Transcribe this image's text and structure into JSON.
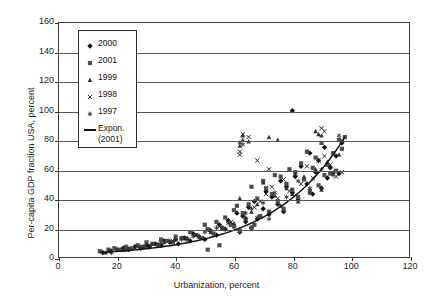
{
  "chart_data": {
    "type": "scatter",
    "title": "",
    "xlabel": "Urbanization, percent",
    "ylabel": "Per-capita GDP fraction USA, percent",
    "xlim": [
      0,
      120
    ],
    "ylim": [
      0,
      160
    ],
    "xticks": [
      0,
      20,
      40,
      60,
      80,
      100,
      120
    ],
    "yticks": [
      0,
      20,
      40,
      60,
      80,
      100,
      120,
      140,
      160
    ],
    "grid": "horizontal",
    "legend_position": "upper-left-inside",
    "legend": [
      {
        "label": "2000",
        "marker": "diamond"
      },
      {
        "label": "2001",
        "marker": "square"
      },
      {
        "label": "1999",
        "marker": "triangle"
      },
      {
        "label": "1998",
        "marker": "x"
      },
      {
        "label": "1997",
        "marker": "star"
      },
      {
        "label": "Expon.",
        "label2": "(2001)",
        "marker": "line"
      }
    ],
    "series": [
      {
        "name": "2000",
        "marker": "diamond",
        "points": [
          [
            15,
            3
          ],
          [
            18,
            4
          ],
          [
            20,
            5
          ],
          [
            22,
            6
          ],
          [
            24,
            5
          ],
          [
            26,
            7
          ],
          [
            28,
            6
          ],
          [
            30,
            8
          ],
          [
            31,
            7
          ],
          [
            33,
            9
          ],
          [
            35,
            8
          ],
          [
            36,
            11
          ],
          [
            38,
            10
          ],
          [
            40,
            12
          ],
          [
            41,
            9
          ],
          [
            43,
            13
          ],
          [
            45,
            11
          ],
          [
            46,
            16
          ],
          [
            48,
            14
          ],
          [
            50,
            12
          ],
          [
            52,
            18
          ],
          [
            54,
            15
          ],
          [
            55,
            22
          ],
          [
            57,
            19
          ],
          [
            58,
            25
          ],
          [
            60,
            21
          ],
          [
            61,
            30
          ],
          [
            62,
            17
          ],
          [
            63,
            28
          ],
          [
            64,
            24
          ],
          [
            65,
            34
          ],
          [
            66,
            20
          ],
          [
            67,
            38
          ],
          [
            68,
            26
          ],
          [
            70,
            33
          ],
          [
            71,
            45
          ],
          [
            72,
            29
          ],
          [
            73,
            41
          ],
          [
            75,
            36
          ],
          [
            76,
            52
          ],
          [
            77,
            31
          ],
          [
            78,
            48
          ],
          [
            80,
            100
          ],
          [
            80,
            44
          ],
          [
            81,
            55
          ],
          [
            82,
            39
          ],
          [
            83,
            62
          ],
          [
            85,
            50
          ],
          [
            86,
            71
          ],
          [
            87,
            43
          ],
          [
            88,
            58
          ],
          [
            89,
            66
          ],
          [
            90,
            47
          ],
          [
            91,
            75
          ],
          [
            92,
            54
          ],
          [
            93,
            61
          ],
          [
            95,
            69
          ],
          [
            96,
            57
          ],
          [
            97,
            78
          ]
        ]
      },
      {
        "name": "2001",
        "marker": "square",
        "points": [
          [
            14,
            4
          ],
          [
            17,
            5
          ],
          [
            19,
            6
          ],
          [
            21,
            5
          ],
          [
            23,
            7
          ],
          [
            25,
            6
          ],
          [
            27,
            8
          ],
          [
            29,
            7
          ],
          [
            30,
            10
          ],
          [
            32,
            9
          ],
          [
            34,
            8
          ],
          [
            35,
            12
          ],
          [
            37,
            11
          ],
          [
            39,
            10
          ],
          [
            40,
            14
          ],
          [
            42,
            13
          ],
          [
            44,
            12
          ],
          [
            45,
            17
          ],
          [
            47,
            15
          ],
          [
            49,
            13
          ],
          [
            51,
            19
          ],
          [
            53,
            16
          ],
          [
            54,
            24
          ],
          [
            56,
            20
          ],
          [
            57,
            27
          ],
          [
            59,
            22
          ],
          [
            60,
            32
          ],
          [
            61,
            35
          ],
          [
            62,
            18
          ],
          [
            63,
            30
          ],
          [
            64,
            26
          ],
          [
            65,
            36
          ],
          [
            66,
            48
          ],
          [
            67,
            22
          ],
          [
            68,
            40
          ],
          [
            69,
            28
          ],
          [
            70,
            52
          ],
          [
            71,
            47
          ],
          [
            72,
            31
          ],
          [
            73,
            43
          ],
          [
            74,
            56
          ],
          [
            75,
            38
          ],
          [
            76,
            55
          ],
          [
            77,
            33
          ],
          [
            78,
            50
          ],
          [
            79,
            60
          ],
          [
            80,
            46
          ],
          [
            81,
            58
          ],
          [
            82,
            41
          ],
          [
            83,
            64
          ],
          [
            84,
            53
          ],
          [
            85,
            72
          ],
          [
            86,
            45
          ],
          [
            87,
            61
          ],
          [
            88,
            68
          ],
          [
            89,
            49
          ],
          [
            90,
            78
          ],
          [
            91,
            56
          ],
          [
            92,
            63
          ],
          [
            93,
            57
          ],
          [
            94,
            71
          ],
          [
            95,
            59
          ],
          [
            96,
            80
          ],
          [
            97,
            74
          ],
          [
            98,
            82
          ],
          [
            50,
            22
          ],
          [
            60,
            21
          ],
          [
            66,
            20
          ],
          [
            55,
            8
          ],
          [
            51,
            5
          ]
        ]
      },
      {
        "name": "1999",
        "marker": "triangle",
        "points": [
          [
            16,
            3
          ],
          [
            20,
            5
          ],
          [
            24,
            6
          ],
          [
            28,
            7
          ],
          [
            32,
            9
          ],
          [
            36,
            10
          ],
          [
            40,
            12
          ],
          [
            44,
            13
          ],
          [
            48,
            14
          ],
          [
            52,
            17
          ],
          [
            56,
            20
          ],
          [
            60,
            23
          ],
          [
            62,
            40
          ],
          [
            64,
            27
          ],
          [
            66,
            31
          ],
          [
            68,
            36
          ],
          [
            70,
            51
          ],
          [
            72,
            30
          ],
          [
            74,
            42
          ],
          [
            76,
            35
          ],
          [
            78,
            47
          ],
          [
            80,
            43
          ],
          [
            82,
            38
          ],
          [
            84,
            55
          ],
          [
            86,
            44
          ],
          [
            88,
            60
          ],
          [
            90,
            46
          ],
          [
            92,
            65
          ],
          [
            94,
            58
          ],
          [
            96,
            70
          ],
          [
            62,
            76
          ],
          [
            63,
            80
          ],
          [
            65,
            79
          ],
          [
            72,
            82
          ],
          [
            75,
            80
          ],
          [
            88,
            86
          ],
          [
            89,
            84
          ],
          [
            90,
            83
          ],
          [
            63,
            83
          ]
        ]
      },
      {
        "name": "1998",
        "marker": "x",
        "points": [
          [
            17,
            4
          ],
          [
            22,
            5
          ],
          [
            27,
            7
          ],
          [
            31,
            8
          ],
          [
            35,
            10
          ],
          [
            39,
            11
          ],
          [
            43,
            13
          ],
          [
            47,
            15
          ],
          [
            51,
            18
          ],
          [
            55,
            21
          ],
          [
            59,
            24
          ],
          [
            62,
            72
          ],
          [
            62,
            70
          ],
          [
            63,
            84
          ],
          [
            65,
            82
          ],
          [
            67,
            34
          ],
          [
            69,
            38
          ],
          [
            71,
            43
          ],
          [
            73,
            48
          ],
          [
            75,
            40
          ],
          [
            77,
            53
          ],
          [
            79,
            45
          ],
          [
            81,
            57
          ],
          [
            83,
            50
          ],
          [
            85,
            62
          ],
          [
            87,
            54
          ],
          [
            89,
            66
          ],
          [
            91,
            69
          ],
          [
            93,
            63
          ],
          [
            95,
            55
          ],
          [
            97,
            58
          ],
          [
            68,
            66
          ],
          [
            72,
            60
          ],
          [
            90,
            88
          ],
          [
            91,
            86
          ]
        ]
      },
      {
        "name": "1997",
        "marker": "star",
        "points": [
          [
            18,
            3
          ],
          [
            23,
            5
          ],
          [
            29,
            7
          ],
          [
            34,
            9
          ],
          [
            38,
            11
          ],
          [
            42,
            12
          ],
          [
            46,
            14
          ],
          [
            50,
            17
          ],
          [
            54,
            20
          ],
          [
            58,
            23
          ],
          [
            62,
            78
          ],
          [
            63,
            77
          ],
          [
            66,
            33
          ],
          [
            70,
            37
          ],
          [
            74,
            44
          ],
          [
            78,
            41
          ],
          [
            82,
            52
          ],
          [
            86,
            47
          ],
          [
            90,
            60
          ],
          [
            94,
            56
          ],
          [
            96,
            83
          ],
          [
            97,
            79
          ],
          [
            64,
            30
          ],
          [
            68,
            27
          ],
          [
            72,
            26
          ]
        ]
      }
    ],
    "trendline": {
      "name": "Expon. (2001)",
      "type": "exponential",
      "x_start": 14,
      "x_end": 98,
      "y_start": 3,
      "y_end": 82,
      "color": "#111111"
    }
  },
  "axis": {
    "y_title": "Per-capita GDP fraction USA, percent",
    "x_title": "Urbanization, percent",
    "yticks": [
      "160",
      "140",
      "120",
      "100",
      "80",
      "60",
      "40",
      "20",
      "0"
    ],
    "xticks": [
      "0",
      "20",
      "40",
      "60",
      "80",
      "100",
      "120"
    ]
  },
  "legend": {
    "items": [
      {
        "label": "2000"
      },
      {
        "label": "2001"
      },
      {
        "label": "1999"
      },
      {
        "label": "1998"
      },
      {
        "label": "1997"
      },
      {
        "label": "Expon.",
        "label2": "(2001)"
      }
    ]
  }
}
